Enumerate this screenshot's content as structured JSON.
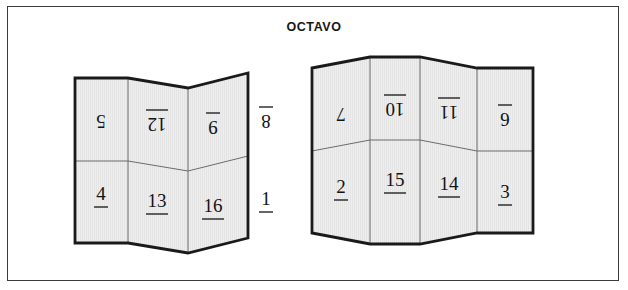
{
  "figure": {
    "title": "OCTAVO",
    "border_color": "#3a3a3a",
    "sheet_fill": "#eeeeee",
    "sheet_stroke": "#1a1a1a",
    "fold_stroke": "#6b6b6b",
    "numeral_color": "#131313",
    "background": "#ffffff"
  },
  "sheets": [
    {
      "name": "left-sheet",
      "label": "left-sheet",
      "panels": [
        {
          "name": "panel-5",
          "value": "5",
          "rotated": true,
          "underlined": false,
          "row": "top",
          "column": 1
        },
        {
          "name": "panel-12",
          "value": "12",
          "rotated": true,
          "underlined": true,
          "row": "top",
          "column": 2
        },
        {
          "name": "panel-9",
          "value": "9",
          "rotated": true,
          "underlined": true,
          "row": "top",
          "column": 3
        },
        {
          "name": "panel-8",
          "value": "8",
          "rotated": true,
          "underlined": true,
          "row": "top",
          "column": 4
        },
        {
          "name": "panel-4",
          "value": "4",
          "rotated": false,
          "underlined": true,
          "row": "bottom",
          "column": 1
        },
        {
          "name": "panel-13",
          "value": "13",
          "rotated": false,
          "underlined": true,
          "row": "bottom",
          "column": 2
        },
        {
          "name": "panel-16",
          "value": "16",
          "rotated": false,
          "underlined": true,
          "row": "bottom",
          "column": 3
        },
        {
          "name": "panel-1",
          "value": "1",
          "rotated": false,
          "underlined": true,
          "row": "bottom",
          "column": 4
        }
      ]
    },
    {
      "name": "right-sheet",
      "label": "right-sheet",
      "panels": [
        {
          "name": "panel-7",
          "value": "7",
          "rotated": true,
          "underlined": false,
          "row": "top",
          "column": 1
        },
        {
          "name": "panel-10",
          "value": "10",
          "rotated": true,
          "underlined": true,
          "row": "top",
          "column": 2
        },
        {
          "name": "panel-11",
          "value": "11",
          "rotated": true,
          "underlined": true,
          "row": "top",
          "column": 3
        },
        {
          "name": "panel-6",
          "value": "6",
          "rotated": true,
          "underlined": true,
          "row": "top",
          "column": 4
        },
        {
          "name": "panel-2",
          "value": "2",
          "rotated": false,
          "underlined": true,
          "row": "bottom",
          "column": 1
        },
        {
          "name": "panel-15",
          "value": "15",
          "rotated": false,
          "underlined": true,
          "row": "bottom",
          "column": 2
        },
        {
          "name": "panel-14",
          "value": "14",
          "rotated": false,
          "underlined": true,
          "row": "bottom",
          "column": 3
        },
        {
          "name": "panel-3",
          "value": "3",
          "rotated": false,
          "underlined": true,
          "row": "bottom",
          "column": 4
        }
      ]
    }
  ]
}
